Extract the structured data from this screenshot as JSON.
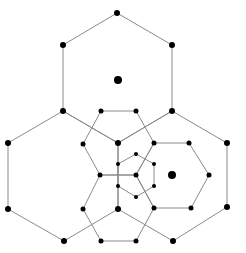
{
  "diagram": {
    "type": "nested-hexagonal-tiling",
    "colors": {
      "edge": "#8a8a8a",
      "node": "#000000",
      "background": "#ffffff"
    },
    "centers": [
      {
        "id": "c-top",
        "x": 118,
        "y": 80,
        "r": 4
      },
      {
        "id": "c-right",
        "x": 172,
        "y": 175,
        "r": 4
      }
    ],
    "nodes": [
      {
        "id": "n1",
        "x": 117,
        "y": 13,
        "r": 3
      },
      {
        "id": "n2",
        "x": 63,
        "y": 45,
        "r": 3
      },
      {
        "id": "n3",
        "x": 172,
        "y": 45,
        "r": 3
      },
      {
        "id": "n4",
        "x": 63,
        "y": 111,
        "r": 3
      },
      {
        "id": "n5",
        "x": 172,
        "y": 111,
        "r": 3
      },
      {
        "id": "n6",
        "x": 101,
        "y": 111,
        "r": 2.5
      },
      {
        "id": "n7",
        "x": 136,
        "y": 111,
        "r": 2.5
      },
      {
        "id": "n8",
        "x": 8,
        "y": 143,
        "r": 3
      },
      {
        "id": "n9",
        "x": 83,
        "y": 144,
        "r": 2.5
      },
      {
        "id": "n10",
        "x": 118,
        "y": 143,
        "r": 3
      },
      {
        "id": "n11",
        "x": 154,
        "y": 143,
        "r": 2.5
      },
      {
        "id": "n12",
        "x": 189,
        "y": 143,
        "r": 2.5
      },
      {
        "id": "n13",
        "x": 227,
        "y": 143,
        "r": 3
      },
      {
        "id": "n14",
        "x": 136,
        "y": 154,
        "r": 2
      },
      {
        "id": "n15",
        "x": 118,
        "y": 164,
        "r": 2
      },
      {
        "id": "n16",
        "x": 154,
        "y": 164,
        "r": 2
      },
      {
        "id": "n17",
        "x": 100,
        "y": 175,
        "r": 2.5
      },
      {
        "id": "n18",
        "x": 136,
        "y": 175,
        "r": 2.5
      },
      {
        "id": "n19",
        "x": 209,
        "y": 175,
        "r": 2.5
      },
      {
        "id": "n20",
        "x": 118,
        "y": 186,
        "r": 2
      },
      {
        "id": "n21",
        "x": 154,
        "y": 186,
        "r": 2
      },
      {
        "id": "n22",
        "x": 136,
        "y": 197,
        "r": 2
      },
      {
        "id": "n23",
        "x": 8,
        "y": 209,
        "r": 3
      },
      {
        "id": "n24",
        "x": 83,
        "y": 209,
        "r": 2.5
      },
      {
        "id": "n25",
        "x": 118,
        "y": 209,
        "r": 3
      },
      {
        "id": "n26",
        "x": 154,
        "y": 208,
        "r": 2.5
      },
      {
        "id": "n27",
        "x": 191,
        "y": 208,
        "r": 2.5
      },
      {
        "id": "n28",
        "x": 227,
        "y": 207,
        "r": 3
      },
      {
        "id": "n29",
        "x": 64,
        "y": 241,
        "r": 3
      },
      {
        "id": "n30",
        "x": 101,
        "y": 241,
        "r": 2.5
      },
      {
        "id": "n31",
        "x": 136,
        "y": 241,
        "r": 2.5
      },
      {
        "id": "n32",
        "x": 173,
        "y": 241,
        "r": 3
      }
    ],
    "polygons": [
      {
        "id": "big-hex-top",
        "points": "117,13 172,45 172,111 118,143 63,111 63,45"
      },
      {
        "id": "big-hex-left",
        "points": "8,143 63,111 118,143 118,209 64,241 8,209"
      },
      {
        "id": "big-hex-right",
        "points": "172,111 227,143 227,207 173,241 118,209 118,143"
      },
      {
        "id": "mid-hex-top",
        "points": "101,111 136,111 154,143 136,175 100,175 83,144"
      },
      {
        "id": "mid-hex-right",
        "points": "154,143 189,143 209,175 191,208 154,208 136,175"
      },
      {
        "id": "mid-hex-bottom",
        "points": "100,175 136,175 154,208 136,241 101,241 83,209"
      },
      {
        "id": "small-hex-center",
        "points": "136,154 154,164 154,186 136,197 118,186 118,164"
      }
    ]
  }
}
